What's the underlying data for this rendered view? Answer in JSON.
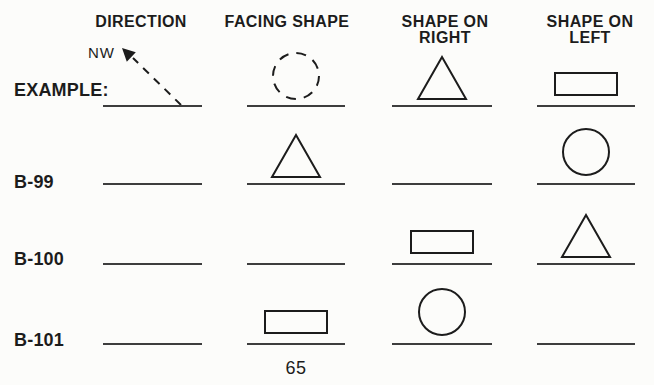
{
  "page": {
    "page_number": "65",
    "colors": {
      "background": "#fcfcfa",
      "ink": "#1c1c1c",
      "rule_line": "#3d3d3d"
    }
  },
  "table": {
    "columns": [
      {
        "id": "direction",
        "lines": [
          "DIRECTION"
        ]
      },
      {
        "id": "facing-shape",
        "lines": [
          "FACING SHAPE"
        ]
      },
      {
        "id": "shape-on-right",
        "lines": [
          "SHAPE ON",
          "RIGHT"
        ]
      },
      {
        "id": "shape-on-left",
        "lines": [
          "SHAPE ON",
          "LEFT"
        ]
      }
    ],
    "rows": [
      {
        "label": "EXAMPLE:",
        "cells": [
          {
            "shape": "nw-arrow",
            "note": "NW"
          },
          {
            "shape": "dashed-circle"
          },
          {
            "shape": "triangle"
          },
          {
            "shape": "rectangle"
          }
        ]
      },
      {
        "label": "B-99",
        "cells": [
          {
            "shape": "none"
          },
          {
            "shape": "triangle"
          },
          {
            "shape": "none"
          },
          {
            "shape": "circle"
          }
        ]
      },
      {
        "label": "B-100",
        "cells": [
          {
            "shape": "none"
          },
          {
            "shape": "none"
          },
          {
            "shape": "rectangle"
          },
          {
            "shape": "triangle"
          }
        ]
      },
      {
        "label": "B-101",
        "cells": [
          {
            "shape": "none"
          },
          {
            "shape": "rectangle"
          },
          {
            "shape": "circle"
          },
          {
            "shape": "none"
          }
        ]
      }
    ]
  }
}
